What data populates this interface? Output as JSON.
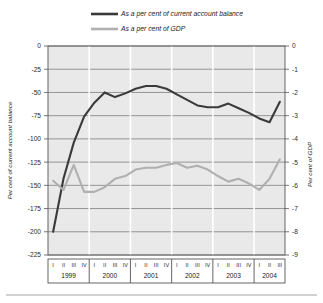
{
  "chart_data": {
    "type": "line",
    "title": "",
    "grid": true,
    "legend_position": "top-center",
    "left_axis": {
      "label": "Per cent of current account balance",
      "ticks": [
        0,
        -25,
        -50,
        -75,
        -100,
        -125,
        -150,
        -175,
        -200,
        -225
      ],
      "ylim": [
        -225,
        0
      ]
    },
    "right_axis": {
      "label": "Per cent of GDP",
      "ticks": [
        0,
        -1,
        -2,
        -3,
        -4,
        -5,
        -6,
        -7,
        -8,
        -9
      ],
      "ylim": [
        -9,
        0
      ]
    },
    "years": [
      {
        "year": "1999",
        "quarters": [
          "I",
          "II",
          "III",
          "IV"
        ]
      },
      {
        "year": "2000",
        "quarters": [
          "I",
          "II",
          "III",
          "IV"
        ]
      },
      {
        "year": "2001",
        "quarters": [
          "I",
          "II",
          "III",
          "IV"
        ]
      },
      {
        "year": "2002",
        "quarters": [
          "I",
          "II",
          "III",
          "IV"
        ]
      },
      {
        "year": "2003",
        "quarters": [
          "I",
          "II",
          "III",
          "IV"
        ]
      },
      {
        "year": "2004",
        "quarters": [
          "I",
          "II",
          "III"
        ]
      }
    ],
    "x": [
      "1999 I",
      "1999 II",
      "1999 III",
      "1999 IV",
      "2000 I",
      "2000 II",
      "2000 III",
      "2000 IV",
      "2001 I",
      "2001 II",
      "2001 III",
      "2001 IV",
      "2002 I",
      "2002 II",
      "2002 III",
      "2002 IV",
      "2003 I",
      "2003 II",
      "2003 III",
      "2003 IV",
      "2004 I",
      "2004 II",
      "2004 III"
    ],
    "series": [
      {
        "name": "As a per cent of current account balance",
        "color": "#3a3a3a",
        "axis": "left",
        "values": [
          -200,
          -143,
          -104,
          -76,
          -61,
          -50,
          -55,
          -51,
          -46,
          -43,
          -43,
          -46,
          -52,
          -58,
          -64,
          -66,
          -66,
          -62,
          -67,
          -72,
          -78,
          -82,
          -60
        ]
      },
      {
        "name": "As a per cent of GDP",
        "color": "#b0b0b0",
        "axis": "left",
        "values": [
          -145,
          -155,
          -128,
          -157,
          -157,
          -152,
          -143,
          -140,
          -133,
          -131,
          -131,
          -128,
          -126,
          -131,
          -129,
          -133,
          -140,
          -146,
          -143,
          -148,
          -155,
          -143,
          -122
        ]
      }
    ],
    "legend": [
      {
        "label": "As a per cent of current account balance",
        "color": "#3a3a3a"
      },
      {
        "label": "As a per cent of GDP",
        "color": "#b0b0b0"
      }
    ]
  }
}
